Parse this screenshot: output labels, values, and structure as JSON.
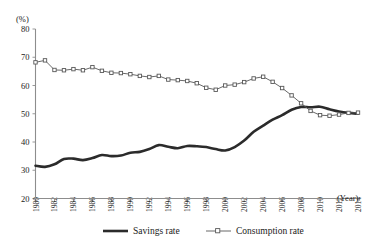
{
  "chart_data": {
    "type": "line",
    "title": "",
    "subtitle": "",
    "xlabel": "(Year)",
    "ylabel": "(%)",
    "ylim": [
      20,
      80
    ],
    "xlim": [
      1980,
      2014
    ],
    "grid": false,
    "legend_position": "bottom",
    "y_ticks": [
      20,
      30,
      40,
      50,
      60,
      70,
      80
    ],
    "y_tick_labels": [
      "20",
      "30",
      "40",
      "50",
      "60",
      "70",
      "80"
    ],
    "x_ticks": [
      1980,
      1982,
      1984,
      1986,
      1988,
      1990,
      1992,
      1994,
      1996,
      1998,
      2000,
      2002,
      2004,
      2006,
      2008,
      2010,
      2012,
      2014
    ],
    "x_tick_labels": [
      "1980",
      "1982",
      "1984",
      "1986",
      "1988",
      "1990",
      "1992",
      "1994",
      "1996",
      "1998",
      "2000",
      "2002",
      "2004",
      "2006",
      "2008",
      "2010",
      "2012",
      "2014"
    ],
    "x": [
      1980,
      1981,
      1982,
      1983,
      1984,
      1985,
      1986,
      1987,
      1988,
      1989,
      1990,
      1991,
      1992,
      1993,
      1994,
      1995,
      1996,
      1997,
      1998,
      1999,
      2000,
      2001,
      2002,
      2003,
      2004,
      2005,
      2006,
      2007,
      2008,
      2009,
      2010,
      2011,
      2012,
      2013,
      2014
    ],
    "series": [
      {
        "name": "Savings rate",
        "style": "thick-solid",
        "marker": "none",
        "color": "#2b2b2b",
        "values": [
          31.6,
          31.2,
          32.1,
          34.0,
          34.1,
          33.6,
          34.3,
          35.4,
          35.0,
          35.2,
          36.2,
          36.5,
          37.5,
          38.9,
          38.3,
          37.8,
          38.6,
          38.5,
          38.2,
          37.5,
          37.0,
          38.2,
          40.5,
          43.6,
          45.8,
          47.9,
          49.5,
          51.4,
          52.4,
          52.3,
          52.5,
          51.6,
          50.8,
          50.3,
          50.0
        ]
      },
      {
        "name": "Consumption rate",
        "style": "thin-solid",
        "marker": "open-square",
        "color": "#585858",
        "values": [
          68.2,
          68.9,
          65.5,
          65.4,
          65.8,
          65.4,
          66.5,
          65.2,
          64.5,
          64.4,
          64.0,
          63.4,
          63.0,
          63.4,
          62.1,
          61.9,
          61.6,
          60.8,
          59.2,
          58.5,
          60.0,
          60.3,
          61.2,
          62.5,
          63.1,
          61.3,
          59.1,
          56.5,
          53.7,
          51.0,
          49.5,
          49.3,
          49.7,
          50.3,
          50.4
        ]
      }
    ],
    "legend": [
      {
        "label": "Savings rate",
        "style": "thick-solid",
        "marker": "none"
      },
      {
        "label": "Consumption rate",
        "style": "thin-solid",
        "marker": "open-square"
      }
    ]
  }
}
